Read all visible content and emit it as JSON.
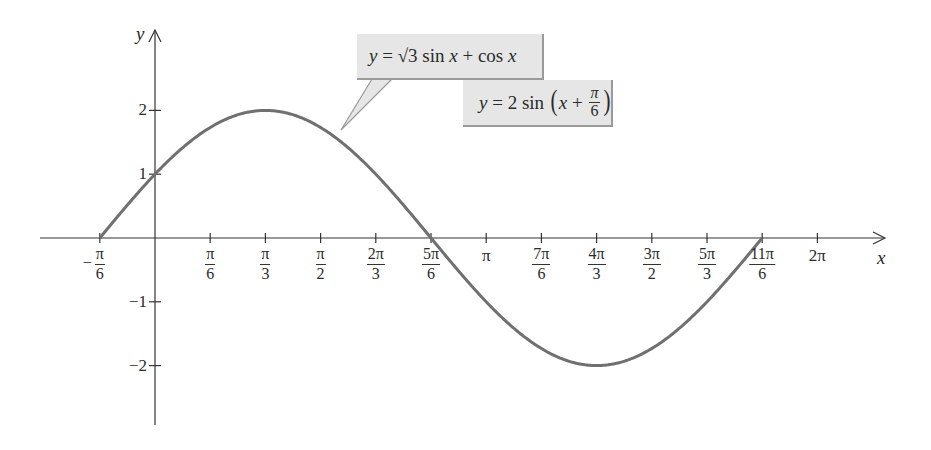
{
  "chart_data": {
    "type": "line",
    "title": "",
    "xlabel": "x",
    "ylabel": "y",
    "function": "y = sqrt(3) sin x + cos x = 2 sin(x + pi/6)",
    "domain": [
      -0.5236,
      5.7596
    ],
    "xlim": [
      -1.0,
      6.6
    ],
    "ylim": [
      -3.0,
      2.9
    ],
    "grid": false,
    "legend": null,
    "x_ticks": [
      {
        "value": -0.5236,
        "num": "π",
        "den": "6",
        "neg": true
      },
      {
        "value": 0.5236,
        "num": "π",
        "den": "6"
      },
      {
        "value": 1.0472,
        "num": "π",
        "den": "3"
      },
      {
        "value": 1.5708,
        "num": "π",
        "den": "2"
      },
      {
        "value": 2.0944,
        "num": "2π",
        "den": "3"
      },
      {
        "value": 2.618,
        "num": "5π",
        "den": "6"
      },
      {
        "value": 3.1416,
        "label": "π"
      },
      {
        "value": 3.6652,
        "num": "7π",
        "den": "6"
      },
      {
        "value": 4.1888,
        "num": "4π",
        "den": "3"
      },
      {
        "value": 4.7124,
        "num": "3π",
        "den": "2"
      },
      {
        "value": 5.236,
        "num": "5π",
        "den": "3"
      },
      {
        "value": 5.7596,
        "num": "11π",
        "den": "6"
      },
      {
        "value": 6.2832,
        "label": "2π"
      }
    ],
    "y_ticks": [
      {
        "value": 2,
        "label": "2"
      },
      {
        "value": 1,
        "label": "1"
      },
      {
        "value": -1,
        "label": "−1"
      },
      {
        "value": -2,
        "label": "−2"
      }
    ],
    "key_points": [
      {
        "x": -0.5236,
        "y": 0
      },
      {
        "x": 0,
        "y": 1
      },
      {
        "x": 1.0472,
        "y": 2
      },
      {
        "x": 2.618,
        "y": 0
      },
      {
        "x": 4.1888,
        "y": -2
      },
      {
        "x": 5.7596,
        "y": 0
      }
    ],
    "annotations": [
      {
        "text": "y = √3 sin x + cos x"
      },
      {
        "text": "y = 2 sin(x + π/6)"
      }
    ],
    "curve_color": "#707070",
    "axis_color": "#333333",
    "callout_bg": "#e6e6e6"
  },
  "axes": {
    "x_label": "x",
    "y_label": "y"
  },
  "callout1": {
    "y": "y",
    "eq": " = √3 sin ",
    "x1": "x",
    "plus": " + cos ",
    "x2": "x"
  },
  "callout2": {
    "y": "y",
    "eq": " = 2 sin ",
    "lp": "(",
    "x": "x",
    "plus": " + ",
    "num": "π",
    "den": "6",
    "rp": ")"
  }
}
